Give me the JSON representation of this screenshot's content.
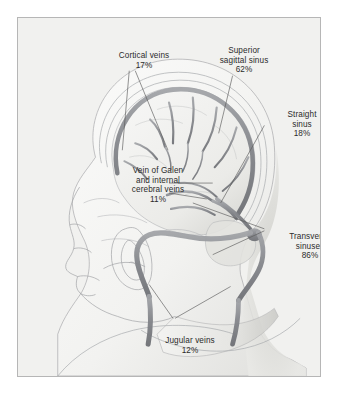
{
  "figure": {
    "frame_border_color": "#b6b6b6",
    "panel_background_color": "#f1f1ef",
    "text_color": "#2b2b2b",
    "vessel_color": "#8d8f93",
    "outline_color": "#9a9c9f"
  },
  "callouts": [
    {
      "id": "cortical-veins",
      "lines": [
        "Cortical veins"
      ],
      "percent": "17%"
    },
    {
      "id": "superior-sagittal-sinus",
      "lines": [
        "Superior",
        "sagittal sinus"
      ],
      "percent": "62%"
    },
    {
      "id": "straight-sinus",
      "lines": [
        "Straight",
        "sinus"
      ],
      "percent": "18%"
    },
    {
      "id": "vein-of-galen",
      "lines": [
        "Vein of Galen",
        "and internal",
        "cerebral veins"
      ],
      "percent": "11%"
    },
    {
      "id": "transverse-sinuses",
      "lines": [
        "Transverse",
        "sinuses"
      ],
      "percent": "86%"
    },
    {
      "id": "jugular-veins",
      "lines": [
        "Jugular veins"
      ],
      "percent": "12%"
    }
  ],
  "labels": {
    "cortical_veins_l1": "Cortical veins",
    "cortical_veins_pct": "17%",
    "superior_sagittal_l1": "Superior",
    "superior_sagittal_l2": "sagittal sinus",
    "superior_sagittal_pct": "62%",
    "straight_sinus_l1": "Straight",
    "straight_sinus_l2": "sinus",
    "straight_sinus_pct": "18%",
    "vein_of_galen_l1": "Vein of Galen",
    "vein_of_galen_l2": "and internal",
    "vein_of_galen_l3": "cerebral veins",
    "vein_of_galen_pct": "11%",
    "transverse_sinuses_l1": "Transverse",
    "transverse_sinuses_l2": "sinuses",
    "transverse_sinuses_pct": "86%",
    "jugular_veins_l1": "Jugular veins",
    "jugular_veins_pct": "12%"
  }
}
